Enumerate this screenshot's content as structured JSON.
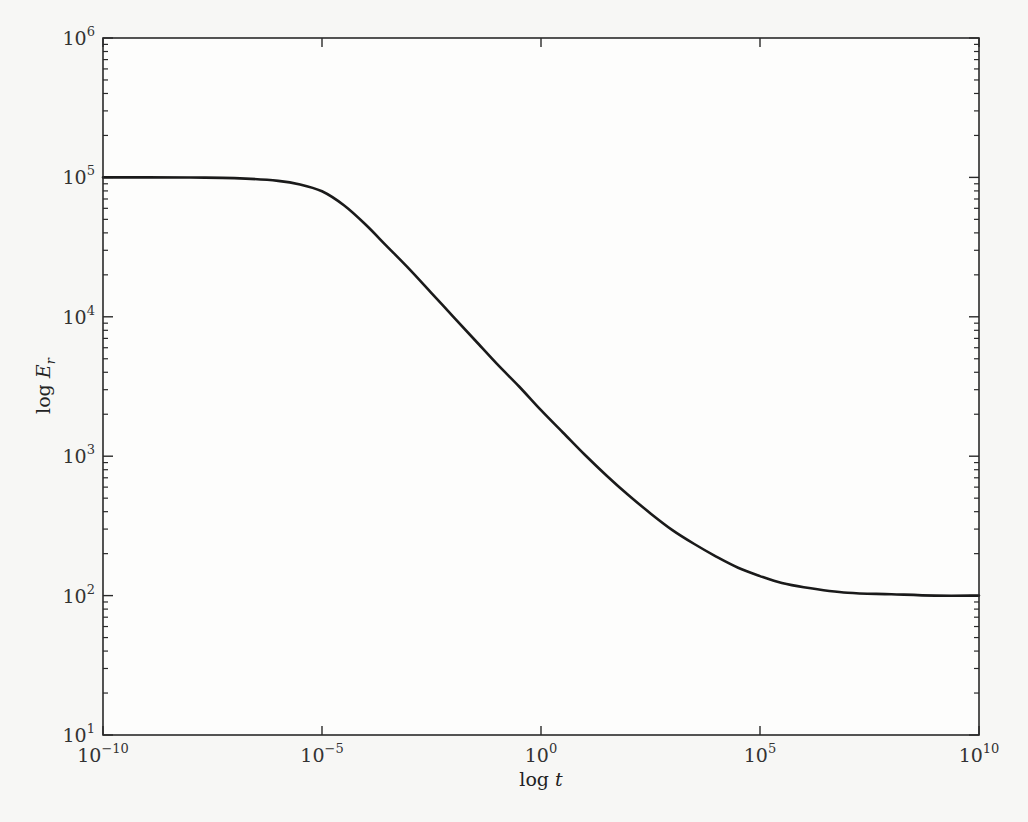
{
  "chart_data": {
    "type": "line",
    "title": "",
    "xlabel": "log t",
    "xlabel_parts": {
      "prefix": "log ",
      "var": "t",
      "sub": ""
    },
    "ylabel": "log E_r",
    "ylabel_parts": {
      "prefix": "log ",
      "var": "E",
      "sub": "r"
    },
    "xscale": "log",
    "yscale": "log",
    "xlim": [
      1e-10,
      10000000000.0
    ],
    "ylim": [
      10,
      1000000
    ],
    "grid": false,
    "legend": null,
    "x_ticks": [
      {
        "value": 1e-10,
        "base": "10",
        "exp": "−10"
      },
      {
        "value": 1e-05,
        "base": "10",
        "exp": "−5"
      },
      {
        "value": 1,
        "base": "10",
        "exp": "0"
      },
      {
        "value": 100000.0,
        "base": "10",
        "exp": "5"
      },
      {
        "value": 10000000000.0,
        "base": "10",
        "exp": "10"
      }
    ],
    "y_ticks": [
      {
        "value": 10,
        "base": "10",
        "exp": "1"
      },
      {
        "value": 100,
        "base": "10",
        "exp": "2"
      },
      {
        "value": 1000,
        "base": "10",
        "exp": "3"
      },
      {
        "value": 10000,
        "base": "10",
        "exp": "4"
      },
      {
        "value": 100000,
        "base": "10",
        "exp": "5"
      },
      {
        "value": 1000000,
        "base": "10",
        "exp": "6"
      }
    ],
    "series": [
      {
        "name": "E_r(t)",
        "color": "#1a1a1a",
        "x_log10": [
          -10,
          -9,
          -8,
          -7,
          -6,
          -5.5,
          -5,
          -4.5,
          -4,
          -3.5,
          -3,
          -2.5,
          -2,
          -1.5,
          -1,
          -0.5,
          0,
          0.5,
          1,
          1.5,
          2,
          2.5,
          3,
          3.5,
          4,
          4.5,
          5,
          5.5,
          6,
          7,
          8,
          9,
          10
        ],
        "y_log10": [
          5.0,
          5.0,
          4.999,
          4.995,
          4.975,
          4.95,
          4.9,
          4.8,
          4.66,
          4.5,
          4.34,
          4.17,
          4.0,
          3.83,
          3.66,
          3.5,
          3.33,
          3.17,
          3.01,
          2.86,
          2.72,
          2.59,
          2.47,
          2.37,
          2.28,
          2.2,
          2.14,
          2.09,
          2.06,
          2.02,
          2.01,
          2.0,
          2.0
        ]
      }
    ]
  }
}
